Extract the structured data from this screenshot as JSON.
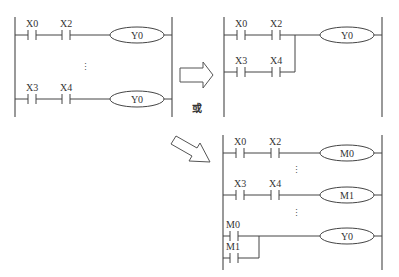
{
  "diagram": {
    "type": "PLC ladder diagram equivalence",
    "left": {
      "rungs": [
        {
          "contacts": [
            "X0",
            "X2"
          ],
          "coil": "Y0"
        },
        {
          "contacts": [
            "X3",
            "X4"
          ],
          "coil": "Y0"
        }
      ],
      "ellipsis": "⋮"
    },
    "top_right": {
      "rungs": [
        {
          "contacts": [
            "X0",
            "X2"
          ],
          "coil": "Y0"
        },
        {
          "contacts": [
            "X3",
            "X4"
          ],
          "parallel_to_rung": 0
        }
      ]
    },
    "bottom_right": {
      "rungs": [
        {
          "contacts": [
            "X0",
            "X2"
          ],
          "coil": "M0"
        },
        {
          "contacts": [
            "X3",
            "X4"
          ],
          "coil": "M1"
        },
        {
          "contacts_parallel": [
            "M0",
            "M1"
          ],
          "coil": "Y0"
        }
      ],
      "ellipsis": "⋮"
    },
    "connector_text": "或",
    "arrows": [
      "right-arrow",
      "diagonal-arrow"
    ]
  },
  "labels": {
    "l_x0": "X0",
    "l_x2": "X2",
    "l_y0a": "Y0",
    "l_x3": "X3",
    "l_x4": "X4",
    "l_y0b": "Y0",
    "tr_x0": "X0",
    "tr_x2": "X2",
    "tr_y0": "Y0",
    "tr_x3": "X3",
    "tr_x4": "X4",
    "br_x0": "X0",
    "br_x2": "X2",
    "br_m0coil": "M0",
    "br_x3": "X3",
    "br_x4": "X4",
    "br_m1coil": "M1",
    "br_m0": "M0",
    "br_m1": "M1",
    "br_y0": "Y0",
    "dots": "⋮",
    "or": "或"
  }
}
